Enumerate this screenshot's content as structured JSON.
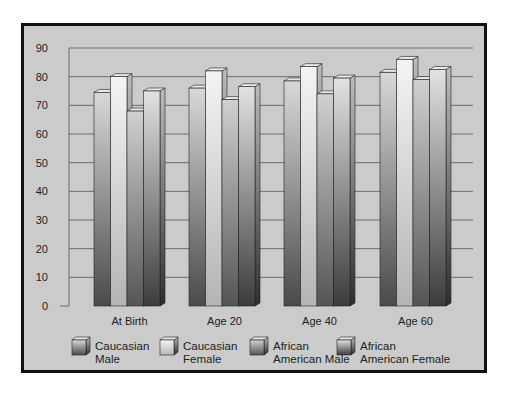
{
  "chart_data": {
    "type": "bar",
    "title": "",
    "xlabel": "",
    "ylabel": "",
    "ylim": [
      0,
      90
    ],
    "yticks": [
      0,
      10,
      20,
      30,
      40,
      50,
      60,
      70,
      80,
      90
    ],
    "grid": true,
    "legend_position": "bottom",
    "categories": [
      "At Birth",
      "Age 20",
      "Age 40",
      "Age 60"
    ],
    "series": [
      {
        "name": "Caucasian Male",
        "legend_lines": [
          "Caucasian",
          "Male"
        ],
        "values": [
          74.5,
          76,
          78.5,
          81.5
        ],
        "color_top": "#d8d8d8",
        "color_bottom": "#4a4a4a"
      },
      {
        "name": "Caucasian Female",
        "legend_lines": [
          "Caucasian",
          "Female"
        ],
        "values": [
          80,
          82,
          83.5,
          86
        ],
        "color_top": "#f4f4f4",
        "color_bottom": "#b4b4b4"
      },
      {
        "name": "African American Male",
        "legend_lines": [
          "African",
          "American Male"
        ],
        "values": [
          68,
          72,
          74,
          79
        ],
        "color_top": "#d0d0d0",
        "color_bottom": "#555555"
      },
      {
        "name": "African American Female",
        "legend_lines": [
          "African",
          "American Female"
        ],
        "values": [
          75,
          76.5,
          79.5,
          82.5
        ],
        "color_top": "#e2e2e2",
        "color_bottom": "#3c3c3c"
      }
    ]
  }
}
